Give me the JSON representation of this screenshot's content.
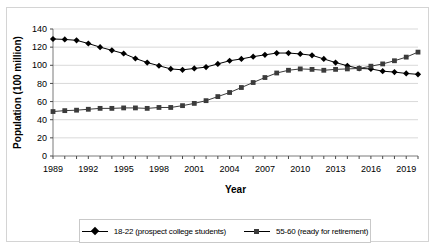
{
  "figure": {
    "background_color": "#ffffff",
    "frame_color": "#d4d4d4",
    "plot_border_color": "#8a8a8a",
    "gridline_color": "#d9d9d9"
  },
  "legend": {
    "position": "bottom",
    "entries": [
      {
        "marker": "diamond",
        "label": "18-22 (prospect college students)",
        "color": "#000000"
      },
      {
        "marker": "square",
        "label": "55-60 (ready for retirement)",
        "color": "#3b3b3b"
      }
    ]
  },
  "chart_data": {
    "type": "line",
    "title": "",
    "xlabel": "Year",
    "ylabel": "Population (100 million)",
    "xlim": [
      1989,
      2020
    ],
    "ylim": [
      0,
      140
    ],
    "ytick_values": [
      0,
      20,
      40,
      60,
      80,
      100,
      120,
      140
    ],
    "ytick_labels": [
      "0",
      "20",
      "40",
      "60",
      "80",
      "100",
      "120",
      "140"
    ],
    "xtick_labels": [
      "1989",
      "1992",
      "1995",
      "1998",
      "2001",
      "2004",
      "2007",
      "2010",
      "2013",
      "2016",
      "2019"
    ],
    "xtick_label_years": [
      1989,
      1992,
      1995,
      1998,
      2001,
      2004,
      2007,
      2010,
      2013,
      2016,
      2019
    ],
    "x": [
      1989,
      1990,
      1991,
      1992,
      1993,
      1994,
      1995,
      1996,
      1997,
      1998,
      1999,
      2000,
      2001,
      2002,
      2003,
      2004,
      2005,
      2006,
      2007,
      2008,
      2009,
      2010,
      2011,
      2012,
      2013,
      2014,
      2015,
      2016,
      2017,
      2018,
      2019,
      2020
    ],
    "grid": true,
    "grid_axis": "y",
    "legend_position": "bottom",
    "series": [
      {
        "name": "18-22 (prospect college students)",
        "marker": "diamond",
        "color": "#000000",
        "values": [
          129,
          128.5,
          127.5,
          124,
          120,
          116.5,
          113,
          107.5,
          103,
          99.5,
          96,
          95,
          96.5,
          98,
          101.5,
          105,
          107,
          109.5,
          111.5,
          113.5,
          113.5,
          112.5,
          111,
          107,
          103,
          99.5,
          96.5,
          96,
          93.5,
          92.5,
          91,
          90
        ]
      },
      {
        "name": "55-60 (ready for retirement)",
        "marker": "square",
        "color": "#3b3b3b",
        "values": [
          49,
          50,
          50.5,
          51.5,
          52.5,
          52.5,
          53,
          53,
          52.5,
          53.5,
          53.5,
          55.5,
          58,
          61,
          65.5,
          70,
          75.5,
          81,
          86.5,
          91.5,
          94.5,
          96,
          95.5,
          94.5,
          95.5,
          96,
          96.5,
          99,
          101.5,
          105,
          109,
          114.5
        ]
      }
    ]
  }
}
